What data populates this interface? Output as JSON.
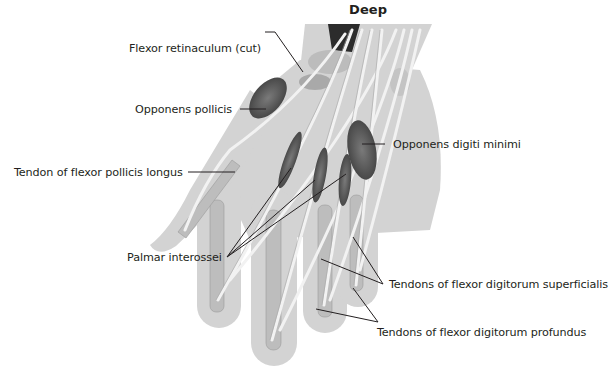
{
  "figure": {
    "title": "Deep",
    "background": "#ffffff",
    "colors": {
      "skin_silhouette": "#cfcfcf",
      "bone": "#d9d9d9",
      "tendon": "#eeeeee",
      "muscle": "#5e5e5e",
      "leader_line": "#231f20"
    }
  },
  "labels": [
    {
      "id": "flexor-retinaculum",
      "text": "Flexor retinaculum (cut)"
    },
    {
      "id": "opponens-pollicis",
      "text": "Opponens pollicis"
    },
    {
      "id": "tendon-fpl",
      "text": "Tendon of flexor pollicis longus"
    },
    {
      "id": "opponens-digiti-minimi",
      "text": "Opponens digiti minimi"
    },
    {
      "id": "palmar-interossei",
      "text": "Palmar interossei"
    },
    {
      "id": "tendons-fds",
      "text": "Tendons of flexor digitorum superficialis"
    },
    {
      "id": "tendons-fdp",
      "text": "Tendons of flexor digitorum profundus"
    }
  ]
}
